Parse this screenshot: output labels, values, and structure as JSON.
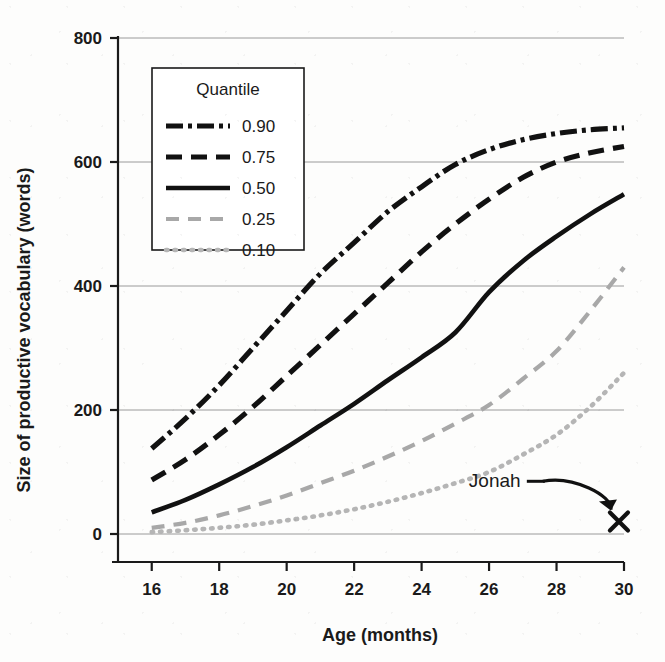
{
  "figure": {
    "background_color": "#fdfdfc",
    "ink_color": "#111111",
    "light_ink_color": "#b0b0b0"
  },
  "chart_data": {
    "type": "line",
    "title": "",
    "subtitle": "",
    "xlabel": "Age (months)",
    "ylabel": "Size of productive vocabulary (words)",
    "xlim": [
      15,
      30
    ],
    "ylim": [
      0,
      800
    ],
    "xticks": [
      16,
      18,
      20,
      22,
      24,
      26,
      28,
      30
    ],
    "xtick_labels": [
      "16",
      "18",
      "20",
      "22",
      "24",
      "26",
      "28",
      "30"
    ],
    "yticks": [
      0,
      200,
      400,
      600,
      800
    ],
    "ytick_labels": [
      "0",
      "200",
      "400",
      "600",
      "800"
    ],
    "grid": "horizontal",
    "legend_position": "upper-left-inside",
    "legend_title": "Quantile",
    "x": [
      16,
      17,
      18,
      19,
      20,
      21,
      22,
      23,
      24,
      25,
      26,
      27,
      28,
      29,
      30
    ],
    "series": [
      {
        "name": "0.90",
        "label": "0.90",
        "style": "dash-dot",
        "color": "#111111",
        "values": [
          138,
          186,
          240,
          300,
          360,
          420,
          470,
          520,
          560,
          596,
          620,
          636,
          646,
          652,
          655
        ]
      },
      {
        "name": "0.75",
        "label": "0.75",
        "style": "dashed",
        "color": "#111111",
        "values": [
          87,
          120,
          160,
          205,
          255,
          305,
          355,
          405,
          455,
          500,
          540,
          575,
          600,
          615,
          625
        ]
      },
      {
        "name": "0.50",
        "label": "0.50",
        "style": "solid",
        "color": "#111111",
        "values": [
          35,
          55,
          80,
          108,
          140,
          175,
          210,
          248,
          285,
          325,
          390,
          440,
          480,
          516,
          548
        ]
      },
      {
        "name": "0.25",
        "label": "0.25",
        "style": "dashed-light",
        "color": "#a8a8a8",
        "values": [
          10,
          18,
          30,
          45,
          62,
          82,
          102,
          125,
          150,
          178,
          208,
          250,
          295,
          360,
          430
        ]
      },
      {
        "name": "0.10",
        "label": "0.10",
        "style": "dotted-light",
        "color": "#b5b5b5",
        "values": [
          3,
          6,
          10,
          15,
          22,
          30,
          40,
          52,
          66,
          82,
          100,
          128,
          160,
          205,
          260
        ]
      }
    ],
    "annotations": [
      {
        "label": "Jonah",
        "marker": "x",
        "marker_x": 29.85,
        "marker_y": 20,
        "label_x": 25.4,
        "label_y": 85
      }
    ]
  }
}
